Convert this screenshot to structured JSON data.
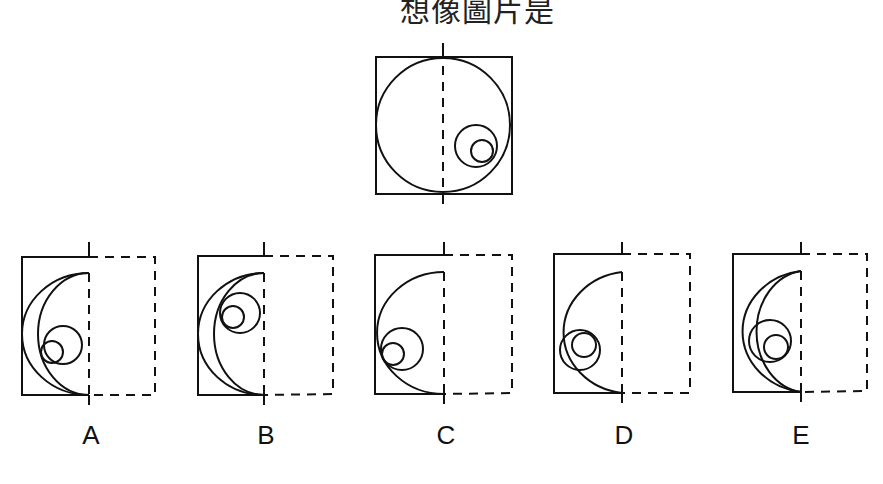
{
  "title": "想像圖片是",
  "question": {
    "main_figure": {
      "description": "square with large circle, dashed vertical fold line through center, two nested small circles on the right side"
    },
    "options": [
      {
        "label": "A"
      },
      {
        "label": "B"
      },
      {
        "label": "C"
      },
      {
        "label": "D"
      },
      {
        "label": "E"
      }
    ]
  },
  "colors": {
    "stroke": "#111111",
    "background": "#ffffff"
  }
}
